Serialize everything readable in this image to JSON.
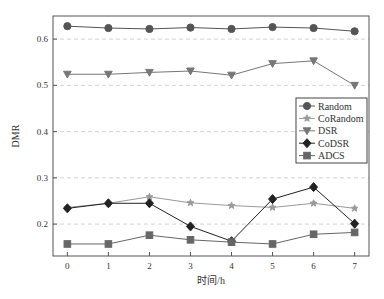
{
  "chart_data": {
    "type": "line",
    "title": "",
    "xlabel": "时间/h",
    "ylabel": "DMR",
    "x": [
      0,
      1,
      2,
      3,
      4,
      5,
      6,
      7
    ],
    "x_ticks": [
      "0",
      "1",
      "2",
      "3",
      "4",
      "5",
      "6",
      "7"
    ],
    "y_ticks": [
      "0.2",
      "0.3",
      "0.4",
      "0.5",
      "0.6"
    ],
    "y_tick_values": [
      0.2,
      0.3,
      0.4,
      0.5,
      0.6
    ],
    "xlim": [
      -0.35,
      7.35
    ],
    "ylim": [
      0.131,
      0.65
    ],
    "grid": "horizontal-dashed",
    "legend_position": "right",
    "series": [
      {
        "name": "Random",
        "marker": "circle",
        "color": "#555555",
        "values": [
          0.628,
          0.624,
          0.622,
          0.625,
          0.622,
          0.626,
          0.624,
          0.617
        ]
      },
      {
        "name": "CoRandom",
        "marker": "star",
        "color": "#999999",
        "values": [
          0.236,
          0.245,
          0.259,
          0.246,
          0.24,
          0.236,
          0.245,
          0.234
        ]
      },
      {
        "name": "DSR",
        "marker": "triangle-down",
        "color": "#777777",
        "values": [
          0.524,
          0.524,
          0.528,
          0.531,
          0.522,
          0.547,
          0.553,
          0.5
        ]
      },
      {
        "name": "CoDSR",
        "marker": "diamond",
        "color": "#222222",
        "values": [
          0.234,
          0.245,
          0.245,
          0.195,
          0.163,
          0.254,
          0.28,
          0.201
        ]
      },
      {
        "name": "ADCS",
        "marker": "square",
        "color": "#666666",
        "values": [
          0.157,
          0.157,
          0.176,
          0.166,
          0.161,
          0.157,
          0.178,
          0.182
        ]
      }
    ]
  }
}
